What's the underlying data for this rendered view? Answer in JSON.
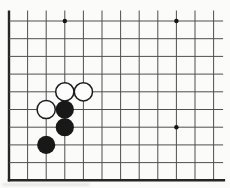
{
  "figure": {
    "kind": "go-board-corner-diagram",
    "background_color": "#fbfbfa",
    "board": {
      "columns": 12,
      "rows": 10,
      "origin_x": 9,
      "origin_y": 21,
      "col_spacing": 18.6,
      "row_spacing": 17.7,
      "top_overhang": 10.5,
      "right_overhang": 9.5,
      "grid_color": "#4f4f4f",
      "grid_width": 1,
      "edge_color": "#262626",
      "edge_width": 2.4,
      "star_color": "#151515",
      "star_radius": 2.2,
      "star_points": [
        {
          "col": 4,
          "row": 1
        },
        {
          "col": 10,
          "row": 1
        },
        {
          "col": 10,
          "row": 7
        }
      ],
      "stone_radius": 9.1,
      "white_stone_fill": "#fdfdfd",
      "white_stone_stroke": "#1c1c1c",
      "white_stone_stroke_width": 1.5,
      "black_stone_fill": "#181818",
      "stones": [
        {
          "color": "white",
          "col": 4,
          "row": 5
        },
        {
          "color": "white",
          "col": 5,
          "row": 5
        },
        {
          "color": "white",
          "col": 3,
          "row": 6
        },
        {
          "color": "black",
          "col": 4,
          "row": 6
        },
        {
          "color": "black",
          "col": 4,
          "row": 7
        },
        {
          "color": "black",
          "col": 3,
          "row": 8
        }
      ]
    }
  }
}
